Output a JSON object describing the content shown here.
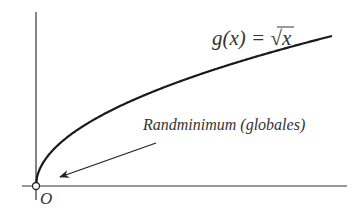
{
  "diagram": {
    "function_label": "g(x) = √x",
    "function_label_parts": {
      "lhs": "g(x) = ",
      "root": "√",
      "arg": "x"
    },
    "annotation": "Randminimum (globales)",
    "origin_label": "O",
    "colors": {
      "curve": "#1a1a1a",
      "axes": "#333333",
      "text": "#333333",
      "background": "#ffffff"
    }
  },
  "chart_data": {
    "type": "line",
    "title": "g(x) = √x",
    "xlabel": "",
    "ylabel": "",
    "series": [
      {
        "name": "g(x) = √x",
        "x": [
          0,
          1,
          4,
          9,
          16,
          25
        ],
        "values": [
          0,
          1,
          2,
          3,
          4,
          5
        ]
      }
    ],
    "annotations": [
      {
        "text": "Randminimum (globales)",
        "points_to": [
          0,
          0
        ]
      }
    ],
    "origin_label": "O",
    "grid": false
  }
}
